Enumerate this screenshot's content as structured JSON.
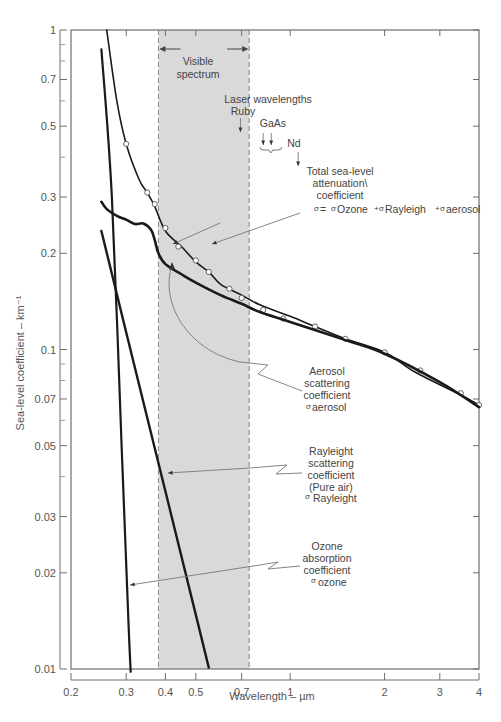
{
  "chart_data": {
    "type": "line",
    "title": "",
    "xlabel": "Wavelength – µm",
    "ylabel": "Sea-level coefficient – km⁻¹",
    "xscale": "log",
    "yscale": "log",
    "xlim": [
      0.2,
      4
    ],
    "ylim": [
      0.01,
      1
    ],
    "grid": false,
    "x_ticks": [
      0.2,
      0.3,
      0.4,
      0.5,
      0.7,
      1,
      2,
      3,
      4
    ],
    "x_tick_labels": [
      "0.2",
      "0.3",
      "0.4",
      "0.5",
      "0.7",
      "1",
      "2",
      "3",
      "4"
    ],
    "y_ticks": [
      1,
      0.7,
      0.5,
      0.3,
      0.2,
      0.1,
      0.07,
      0.05,
      0.03,
      0.02,
      0.01
    ],
    "y_tick_labels": [
      "1",
      "0.7",
      "0.5",
      "0.3",
      "0.2",
      "0.1",
      "0.07",
      "0.05",
      "0.03",
      "0.02",
      "0.01"
    ],
    "y_minor_ticks": [
      0.9,
      0.8,
      0.6,
      0.4,
      0.09,
      0.08,
      0.06,
      0.04
    ],
    "shaded_region": {
      "label": "Visible spectrum",
      "x_range": [
        0.38,
        0.74
      ],
      "color": "#d9d9d9"
    },
    "series": [
      {
        "name": "Total sea-level attenuation coefficient",
        "markers": "open-circle",
        "x": [
          0.26,
          0.28,
          0.3,
          0.33,
          0.35,
          0.37,
          0.4,
          0.45,
          0.5,
          0.55,
          0.6,
          0.7,
          0.8,
          1.0,
          1.2,
          1.5,
          2.0,
          2.5,
          3.5,
          4.0
        ],
        "y": [
          1.0,
          0.6,
          0.44,
          0.34,
          0.31,
          0.28,
          0.235,
          0.21,
          0.188,
          0.175,
          0.16,
          0.148,
          0.138,
          0.127,
          0.118,
          0.108,
          0.098,
          0.085,
          0.072,
          0.067
        ],
        "marker_points": {
          "x": [
            0.3,
            0.35,
            0.37,
            0.4,
            0.44,
            0.5,
            0.55,
            0.64,
            0.7,
            0.82,
            0.95,
            1.2,
            1.5,
            2.0,
            2.6,
            3.5,
            4.0
          ],
          "y": [
            0.44,
            0.31,
            0.285,
            0.24,
            0.21,
            0.19,
            0.175,
            0.155,
            0.145,
            0.133,
            0.125,
            0.118,
            0.108,
            0.098,
            0.086,
            0.073,
            0.067
          ]
        }
      },
      {
        "name": "Aerosol scattering coefficient",
        "x": [
          0.25,
          0.26,
          0.28,
          0.3,
          0.32,
          0.34,
          0.36,
          0.37,
          0.38,
          0.4,
          0.45,
          0.5,
          0.6,
          0.7,
          0.8,
          1.0,
          1.5,
          2.0,
          3.0,
          4.0
        ],
        "y": [
          0.29,
          0.275,
          0.262,
          0.255,
          0.247,
          0.248,
          0.237,
          0.22,
          0.2,
          0.185,
          0.172,
          0.162,
          0.148,
          0.139,
          0.131,
          0.122,
          0.107,
          0.097,
          0.079,
          0.066
        ]
      },
      {
        "name": "Rayleigh scattering coefficient (Pure air)",
        "x": [
          0.25,
          0.3,
          0.4,
          0.5,
          0.55
        ],
        "y": [
          0.235,
          0.113,
          0.036,
          0.0148,
          0.0101
        ]
      },
      {
        "name": "Ozone absorption coefficient",
        "x": [
          0.25,
          0.27,
          0.29,
          0.305,
          0.31
        ],
        "y": [
          0.87,
          0.3,
          0.05,
          0.014,
          0.0098
        ]
      }
    ],
    "annotations": [
      {
        "text": "Visible spectrum",
        "lines": [
          "Visible",
          "spectrum"
        ]
      },
      {
        "text": "Laser wavelengths Ruby",
        "lines": [
          "Laser wavelengths",
          "Ruby"
        ],
        "x": 0.694
      },
      {
        "text": "GaAs",
        "x": [
          0.82,
          0.87
        ]
      },
      {
        "text": "Nd",
        "x": 1.06
      },
      {
        "text": "Total sea-level attenuation coefficient σ = σOzone + σRayleigh + σaerosol"
      },
      {
        "text": "Aerosol scattering coefficient σaerosol"
      },
      {
        "text": "Rayleight scattering coefficient (Pure air) σ Rayleight"
      },
      {
        "text": "Ozone absorption coefficient σ ozone"
      }
    ]
  },
  "labels": {
    "xlabel": "Wavelength – µm",
    "ylabel": "Sea-level coefficient – km⁻¹",
    "visible_1": "Visible",
    "visible_2": "spectrum",
    "laser_1": "Laser wavelengths",
    "laser_2": "Ruby",
    "gaas": "GaAs",
    "nd": "Nd",
    "total_1": "Total sea-level",
    "total_2": "attenuation\\",
    "total_3": "coefficient",
    "total_eq_sigma": "σ",
    "total_eq_1": "= ",
    "total_eq_ozone": "Ozone",
    "total_eq_rayleigh": "Rayleigh",
    "total_eq_aerosol": "aerosol",
    "aerosol_1": "Aerosol",
    "aerosol_2": "scattering",
    "aerosol_3": "coefficient",
    "aerosol_4": "aerosol",
    "rayleigh_1": "Rayleight",
    "rayleigh_2": "scattering",
    "rayleigh_3": "coefficient",
    "rayleigh_4": "(Pure air)",
    "rayleigh_5": "Rayleight",
    "ozone_1": "Ozone",
    "ozone_2": "absorption",
    "ozone_3": "coefficient",
    "ozone_4": "ozone",
    "sigma": "σ",
    "plus": "+"
  },
  "colors": {
    "frame": "#6e6e6e",
    "curve": "#1a1a1a",
    "shade": "#d9d9d9",
    "leader": "#777777",
    "text": "#444444"
  }
}
